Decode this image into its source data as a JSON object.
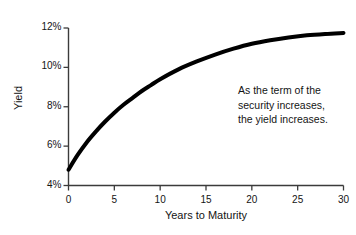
{
  "chart_data": {
    "type": "line",
    "title": "",
    "subtitle": "",
    "xlabel": "Years to Maturity",
    "ylabel": "Yield",
    "xlim": [
      0,
      30
    ],
    "ylim": [
      4,
      12
    ],
    "grid": false,
    "legend": null,
    "xticks": [
      "0",
      "5",
      "10",
      "15",
      "20",
      "25",
      "30"
    ],
    "xtick_values": [
      0,
      5,
      10,
      15,
      20,
      25,
      30
    ],
    "yticks": [
      "4%",
      "6%",
      "8%",
      "10%",
      "12%"
    ],
    "ytick_values": [
      4,
      6,
      8,
      10,
      12
    ],
    "series": [
      {
        "name": "Yield curve",
        "color": "#000000",
        "linewidth": 4,
        "x": [
          0,
          1,
          2,
          3,
          4,
          5,
          6,
          7,
          8,
          9,
          10,
          12,
          14,
          16,
          18,
          20,
          22,
          24,
          26,
          28,
          30
        ],
        "values": [
          4.8,
          5.55,
          6.2,
          6.75,
          7.25,
          7.7,
          8.1,
          8.45,
          8.8,
          9.1,
          9.4,
          9.9,
          10.3,
          10.65,
          10.95,
          11.2,
          11.38,
          11.52,
          11.63,
          11.7,
          11.75
        ]
      }
    ],
    "annotations": [
      {
        "name": "trend-note",
        "lines": [
          "As the term of the",
          "security increases,",
          "the yield increases."
        ]
      }
    ]
  },
  "colors": {
    "axis": "#3b3b3b",
    "curve": "#000000",
    "text": "#141414",
    "background": "#ffffff"
  }
}
